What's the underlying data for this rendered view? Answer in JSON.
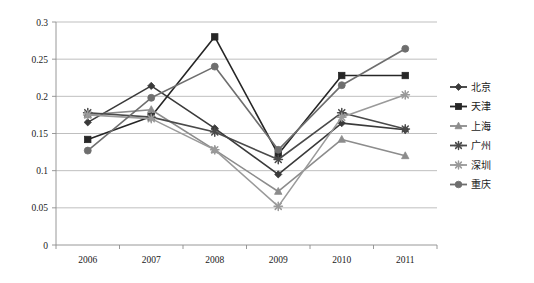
{
  "chart_data": {
    "type": "line",
    "title": "",
    "xlabel": "",
    "ylabel": "",
    "categories": [
      "2006",
      "2007",
      "2008",
      "2009",
      "2010",
      "2011"
    ],
    "x_tick_labels": [
      "2006",
      "2007",
      "2008",
      "2009",
      "2010",
      "2011"
    ],
    "y_tick_labels": [
      "0",
      "0.05",
      "0.1",
      "0.15",
      "0.2",
      "0.25",
      "0.3"
    ],
    "y_tick_values": [
      0,
      0.05,
      0.1,
      0.15,
      0.2,
      0.25,
      0.3
    ],
    "ylim": [
      0,
      0.3
    ],
    "grid": "horizontal",
    "legend_position": "right",
    "series": [
      {
        "name": "北京",
        "marker": "diamond",
        "color": "#3a3a3a",
        "values": [
          0.165,
          0.214,
          0.157,
          0.095,
          0.164,
          0.155
        ]
      },
      {
        "name": "天津",
        "marker": "square",
        "color": "#262626",
        "values": [
          0.142,
          0.173,
          0.28,
          0.122,
          0.228,
          0.228
        ]
      },
      {
        "name": "上海",
        "marker": "triangle",
        "color": "#8c8c8c",
        "values": [
          0.175,
          0.182,
          0.128,
          0.072,
          0.142,
          0.12
        ]
      },
      {
        "name": "广州",
        "marker": "star",
        "color": "#4a4a4a",
        "values": [
          0.178,
          0.172,
          0.152,
          0.115,
          0.178,
          0.156
        ]
      },
      {
        "name": "深圳",
        "marker": "star",
        "color": "#9a9a9a",
        "values": [
          0.175,
          0.17,
          0.128,
          0.052,
          0.172,
          0.202
        ]
      },
      {
        "name": "重庆",
        "marker": "circle",
        "color": "#6e6e6e",
        "values": [
          0.127,
          0.198,
          0.24,
          0.128,
          0.215,
          0.264
        ]
      }
    ]
  }
}
